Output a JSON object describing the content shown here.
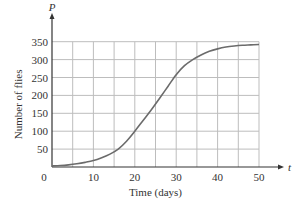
{
  "chart_data": {
    "type": "line",
    "title": "",
    "xlabel": "Time (days)",
    "ylabel": "Number of flies",
    "x_axis_variable": "t",
    "y_axis_variable": "P",
    "xlim": [
      0,
      50
    ],
    "ylim": [
      0,
      350
    ],
    "x_ticks": [
      0,
      10,
      20,
      30,
      40,
      50
    ],
    "y_ticks": [
      50,
      100,
      150,
      200,
      250,
      300,
      350
    ],
    "x_tick_labels": [
      "0",
      "10",
      "20",
      "30",
      "40",
      "50"
    ],
    "y_tick_labels": [
      "50",
      "100",
      "150",
      "200",
      "250",
      "300",
      "350"
    ],
    "origin_label": "0",
    "grid": true,
    "grid_x_step": 5,
    "grid_y_step": 50,
    "legend": null,
    "series": [
      {
        "name": "P(t)",
        "x": [
          0,
          2,
          4,
          6,
          8,
          10,
          12,
          14,
          16,
          18,
          20,
          22,
          24,
          26,
          28,
          30,
          32,
          34,
          36,
          38,
          40,
          42,
          44,
          46,
          48,
          50
        ],
        "values": [
          3,
          4,
          6,
          9,
          13,
          18,
          26,
          36,
          50,
          72,
          100,
          130,
          160,
          192,
          225,
          258,
          283,
          300,
          313,
          323,
          330,
          335,
          338,
          340,
          341,
          342
        ]
      }
    ]
  }
}
